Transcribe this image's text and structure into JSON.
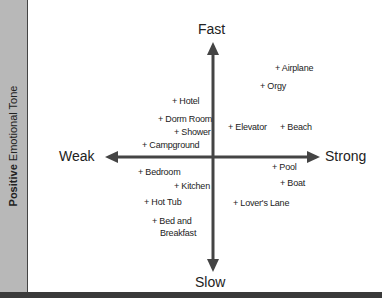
{
  "sidebar": {
    "label_bold": "Positive",
    "label_rest": " Emotional Tone"
  },
  "axes": {
    "top": "Fast",
    "bottom": "Slow",
    "left": "Weak",
    "right": "Strong"
  },
  "colors": {
    "sidebar": "#b8b8b8",
    "axis": "#444444",
    "bottom_bar": "#3a3a3a"
  },
  "points": [
    {
      "label": "+ Airplane",
      "x": 275,
      "y": 63
    },
    {
      "label": "+ Orgy",
      "x": 260,
      "y": 81
    },
    {
      "label": "+ Hotel",
      "x": 172,
      "y": 96
    },
    {
      "label": "+ Dorm Room",
      "x": 158,
      "y": 114
    },
    {
      "label": "+ Shower",
      "x": 174,
      "y": 127
    },
    {
      "label": "+ Elevator",
      "x": 228,
      "y": 122
    },
    {
      "label": "+ Beach",
      "x": 280,
      "y": 122
    },
    {
      "label": "+ Campground",
      "x": 142,
      "y": 140
    },
    {
      "label": "+ Bedroom",
      "x": 138,
      "y": 167
    },
    {
      "label": "+ Pool",
      "x": 272,
      "y": 162
    },
    {
      "label": "+ Kitchen",
      "x": 174,
      "y": 181
    },
    {
      "label": "+ Boat",
      "x": 280,
      "y": 178
    },
    {
      "label": "+ Hot Tub",
      "x": 144,
      "y": 197
    },
    {
      "label": "+ Lover's Lane",
      "x": 233,
      "y": 198
    },
    {
      "label": "+ Bed and",
      "x": 152,
      "y": 216
    },
    {
      "label": "Breakfast",
      "x": 160,
      "y": 228
    }
  ]
}
